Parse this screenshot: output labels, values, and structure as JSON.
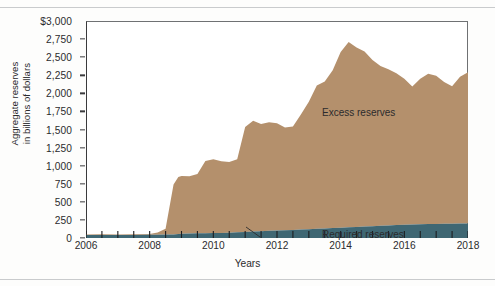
{
  "chart_data": {
    "type": "area",
    "title": "",
    "subtitle": "",
    "xlabel": "Years",
    "ylabel": "Aggregate reserves in billions of dollars",
    "ylabel_lines": [
      "Aggregate reserves",
      "in billions of dollars"
    ],
    "stacked": true,
    "grid": false,
    "legend_position": "inline-annotations",
    "xlim": [
      2006,
      2018
    ],
    "ylim": [
      0,
      3000
    ],
    "x_ticks": [
      2006,
      2008,
      2010,
      2012,
      2014,
      2016,
      2018
    ],
    "x_tick_labels": [
      "2006",
      "2008",
      "2010",
      "2012",
      "2014",
      "2016",
      "2018"
    ],
    "x_minor_tick_step": 0.5,
    "y_ticks": [
      0,
      250,
      500,
      750,
      1000,
      1250,
      1500,
      1750,
      2000,
      2250,
      2500,
      2750,
      3000
    ],
    "y_tick_labels": [
      "0",
      "250",
      "500",
      "750",
      "1,000",
      "1,250",
      "1,500",
      "1,750",
      "2,000",
      "2,250",
      "2,500",
      "2,750",
      "$3,000"
    ],
    "annotations": [
      {
        "text": "Excess reserves",
        "x": 2011.4,
        "y": 2080
      },
      {
        "text": "Required reserves",
        "x": 2011.4,
        "y": 330
      }
    ],
    "colors": {
      "excess_reserves": "#b4906c",
      "required_reserves": "#3f6773",
      "axis": "#2b2b2d",
      "text": "#2b2b2d",
      "plot_background": "#ffffff",
      "page_background": "#fdfdfc",
      "page_rule": "#c9cbcd"
    },
    "x": [
      2006.0,
      2006.5,
      2007.0,
      2007.5,
      2008.0,
      2008.25,
      2008.5,
      2008.75,
      2008.9,
      2009.0,
      2009.25,
      2009.5,
      2009.75,
      2010.0,
      2010.25,
      2010.5,
      2010.75,
      2011.0,
      2011.25,
      2011.5,
      2011.75,
      2012.0,
      2012.25,
      2012.5,
      2012.75,
      2013.0,
      2013.25,
      2013.5,
      2013.75,
      2014.0,
      2014.25,
      2014.5,
      2014.75,
      2015.0,
      2015.25,
      2015.5,
      2015.75,
      2016.0,
      2016.25,
      2016.5,
      2016.75,
      2017.0,
      2017.25,
      2017.5,
      2017.75,
      2018.0
    ],
    "series": [
      {
        "name": "Required reserves",
        "color": "#3f6773",
        "values": [
          42,
          43,
          42,
          42,
          44,
          45,
          48,
          50,
          55,
          58,
          62,
          64,
          66,
          68,
          70,
          72,
          78,
          84,
          90,
          95,
          100,
          105,
          108,
          112,
          118,
          122,
          128,
          132,
          138,
          142,
          148,
          152,
          158,
          162,
          168,
          172,
          178,
          182,
          186,
          190,
          192,
          194,
          196,
          198,
          200,
          200
        ]
      },
      {
        "name": "Excess reserves",
        "color": "#b4906c",
        "values": [
          8,
          9,
          8,
          9,
          12,
          30,
          80,
          690,
          790,
          800,
          790,
          820,
          1000,
          1020,
          990,
          980,
          1010,
          1450,
          1530,
          1480,
          1500,
          1480,
          1420,
          1430,
          1590,
          1760,
          1980,
          2030,
          2180,
          2430,
          2560,
          2480,
          2420,
          2300,
          2210,
          2160,
          2100,
          2020,
          1910,
          2010,
          2080,
          2050,
          1960,
          1900,
          2030,
          2090
        ]
      }
    ],
    "notes": {
      "peak_excess_reserves": 2650,
      "peak_year": 2014.3
    }
  }
}
